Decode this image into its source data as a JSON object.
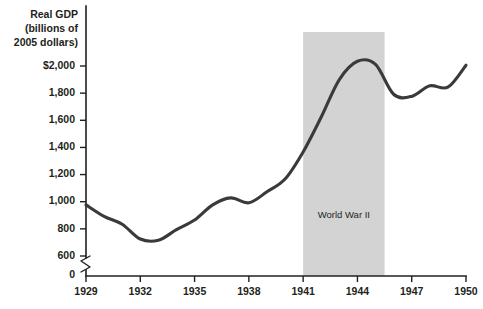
{
  "chart_data": {
    "type": "line",
    "title": "",
    "ylabel": "Real GDP (billions of 2005 dollars)",
    "ylabel_lines": [
      "Real GDP",
      "(billions of",
      "2005 dollars)"
    ],
    "xlabel": "",
    "grid": false,
    "legend_position": "none",
    "axis_break": true,
    "axis_break_note": "y-axis broken between 0 and 600",
    "ylim": [
      600,
      2000
    ],
    "y_zero_label": "0",
    "yticks": [
      600,
      800,
      1000,
      1200,
      1400,
      1600,
      1800,
      2000
    ],
    "ytick_labels": [
      "600",
      "800",
      "1,000",
      "1,200",
      "1,400",
      "1,600",
      "1,800",
      "$2,000"
    ],
    "xlim": [
      1929,
      1950
    ],
    "xticks": [
      1929,
      1932,
      1935,
      1938,
      1941,
      1944,
      1947,
      1950
    ],
    "xtick_labels": [
      "1929",
      "1932",
      "1935",
      "1938",
      "1941",
      "1944",
      "1947",
      "1950"
    ],
    "x": [
      1929,
      1930,
      1931,
      1932,
      1933,
      1934,
      1935,
      1936,
      1937,
      1938,
      1939,
      1940,
      1941,
      1942,
      1943,
      1944,
      1945,
      1946,
      1947,
      1948,
      1949,
      1950
    ],
    "values": [
      977,
      892,
      834,
      725,
      716,
      794,
      865,
      977,
      1028,
      992,
      1073,
      1167,
      1367,
      1624,
      1900,
      2035,
      2012,
      1792,
      1776,
      1854,
      1844,
      2006
    ],
    "series": [
      {
        "name": "Real GDP",
        "values": [
          977,
          892,
          834,
          725,
          716,
          794,
          865,
          977,
          1028,
          992,
          1073,
          1167,
          1367,
          1624,
          1900,
          2035,
          2012,
          1792,
          1776,
          1854,
          1844,
          2006
        ]
      }
    ],
    "annotations": [
      {
        "label": "World War II",
        "type": "shaded-band",
        "x_start": 1941,
        "x_end": 1945.5,
        "color": "#d3d3d3",
        "label_value": 900
      }
    ],
    "colors": {
      "line": "#3a3a3a",
      "band": "#d3d3d3",
      "axis": "#231f20",
      "background": "#ffffff"
    }
  }
}
